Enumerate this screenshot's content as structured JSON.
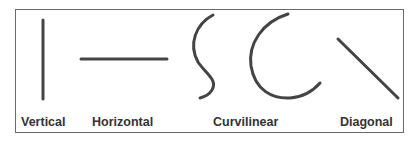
{
  "figure": {
    "line_color": "#444444",
    "border_color": "#6a6a6a",
    "labels": {
      "vertical": "Vertical",
      "horizontal": "Horizontal",
      "curvilinear": "Curvilinear",
      "diagonal": "Diagonal"
    }
  }
}
